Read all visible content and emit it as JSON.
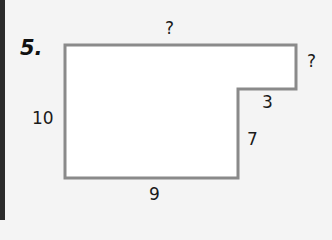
{
  "problem": {
    "number": "5.",
    "labels": {
      "top": "?",
      "right_top": "?",
      "step_horizontal": "3",
      "step_vertical": "7",
      "left": "10",
      "bottom": "9"
    },
    "colors": {
      "outline": "#8a8a8a",
      "fill": "#ffffff",
      "background": "#f4f4f4"
    }
  }
}
